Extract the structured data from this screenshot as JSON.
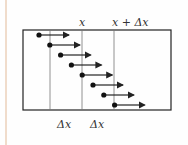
{
  "diagram": {
    "labels": {
      "x_top": "x",
      "x_plus_dx_top": "x + Δx",
      "dx_bottom_left": "Δx",
      "dx_bottom_right": "Δx"
    },
    "arrow_count": 8,
    "colors": {
      "stroke": "#222222",
      "guide": "#777777",
      "edge": "#f0dccb"
    }
  }
}
